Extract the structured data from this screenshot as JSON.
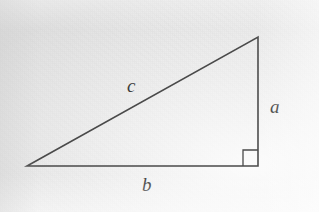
{
  "figure": {
    "name": "right-triangle-diagram",
    "width": 319,
    "height": 212,
    "background_color": "#e4e4e4",
    "stroke_color": "#4a4a4a",
    "label_color": "#3c3c3c",
    "stroke_width": 1.6
  },
  "labels": {
    "hypotenuse": "c",
    "vertical_leg": "a",
    "horizontal_leg": "b"
  },
  "geometry": {
    "vertex_left": {
      "x": 27,
      "y": 166
    },
    "vertex_bottom_right": {
      "x": 258,
      "y": 166
    },
    "vertex_top_right": {
      "x": 258,
      "y": 37
    },
    "right_angle_marker": {
      "x": 243,
      "y": 150,
      "size": 16
    },
    "polygon_points": "27,166 258,166 258,37",
    "right_angle_path": "M 243 166 L 243 150 L 258 150"
  },
  "icons": {
    "right_angle": "right-angle-marker-icon"
  }
}
